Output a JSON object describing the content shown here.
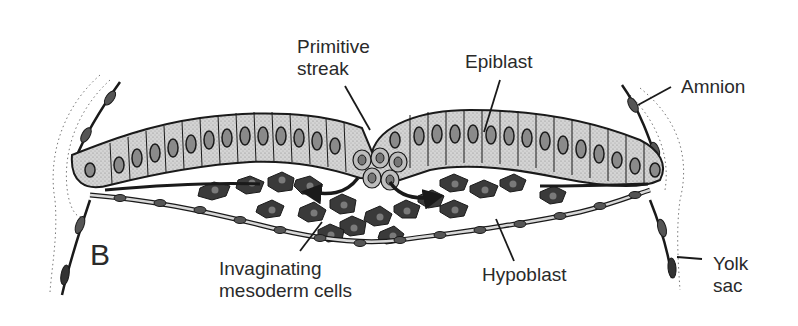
{
  "figure": {
    "panel_letter": "B"
  },
  "labels": {
    "primitive_streak": [
      "Primitive",
      "streak"
    ],
    "epiblast": "Epiblast",
    "amnion": "Amnion",
    "invaginating_mesoderm": [
      "Invaginating",
      "mesoderm cells"
    ],
    "hypoblast": "Hypoblast",
    "yolk_sac": [
      "Yolk",
      "sac"
    ]
  },
  "colors": {
    "line": "#1a1a1a",
    "epiblast_fill": "#c9c9c9",
    "mesoderm_fill": "#3a3a3a",
    "nucleus_fill": "#8a8a8a",
    "text": "#2a2a2a",
    "background": "#ffffff"
  }
}
